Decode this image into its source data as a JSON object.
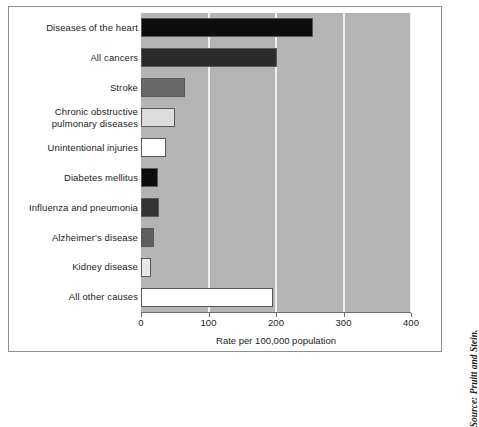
{
  "figure": {
    "source_note": "Source: Pruitt and Stein."
  },
  "chart_data": {
    "type": "bar",
    "orientation": "horizontal",
    "title": "",
    "xlabel": "Rate per 100,000 population",
    "ylabel": "",
    "xlim": [
      0,
      400
    ],
    "xticks": [
      0,
      100,
      200,
      300,
      400
    ],
    "xticklabels": [
      "0",
      "100",
      "200",
      "300",
      "400"
    ],
    "grid": "vertical",
    "legend": "none",
    "plot_background": "#b4b4b4",
    "gridline_color": "#f0f0f0",
    "categories": [
      "Diseases of the heart",
      "All cancers",
      "Stroke",
      "Chronic obstructive pulmonary diseases",
      "Unintentional injuries",
      "Diabetes mellitus",
      "Influenza and pneumonia",
      "Alzheimer's disease",
      "Kidney disease",
      "All other causes"
    ],
    "category_label_lines": [
      [
        "Diseases of the heart"
      ],
      [
        "All cancers"
      ],
      [
        "Stroke"
      ],
      [
        "Chronic obstructive",
        "pulmonary diseases"
      ],
      [
        "Unintentional injuries"
      ],
      [
        "Diabetes mellitus"
      ],
      [
        "Influenza and pneumonia"
      ],
      [
        "Alzheimer's disease"
      ],
      [
        "Kidney disease"
      ],
      [
        "All other causes"
      ]
    ],
    "values": [
      255,
      202,
      65,
      50,
      37,
      25,
      26,
      19,
      15,
      196
    ],
    "bar_colors": [
      "#0d0d0d",
      "#2b2b2b",
      "#6a6a6a",
      "#dcdcdc",
      "#ffffff",
      "#0d0d0d",
      "#343434",
      "#5e5e5e",
      "#e8e8e8",
      "#ffffff"
    ],
    "bar_edge_color": "#585858"
  }
}
